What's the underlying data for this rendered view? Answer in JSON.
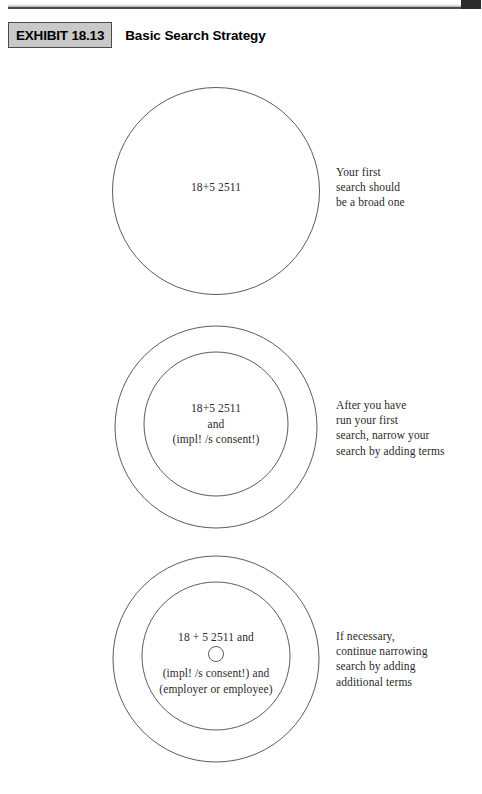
{
  "header": {
    "exhibit_tag": "EXHIBIT 18.13",
    "title": "Basic Search Strategy"
  },
  "diagram": {
    "type": "concentric-circles",
    "stages": [
      {
        "id": "stage-1",
        "rings": 1,
        "circle_text": "18+5 2511",
        "annotation": "Your first\nsearch should\nbe a broad one"
      },
      {
        "id": "stage-2",
        "rings": 2,
        "circle_text": "18+5 2511\nand\n(impl! /s consent!)",
        "annotation": "After you have\nrun your first\nsearch, narrow your\nsearch by adding terms"
      },
      {
        "id": "stage-3",
        "rings": 3,
        "circle_text_top": "18 + 5 2511 and",
        "circle_text_bottom": "(impl! /s consent!) and\n(employer or employee)",
        "annotation": "If necessary,\ncontinue narrowing\nsearch by adding\nadditional terms"
      }
    ]
  },
  "colors": {
    "stroke": "#4a4a4a",
    "text": "#2a2a2a",
    "tag_fill": "#c9c9c9",
    "background": "#ffffff"
  }
}
